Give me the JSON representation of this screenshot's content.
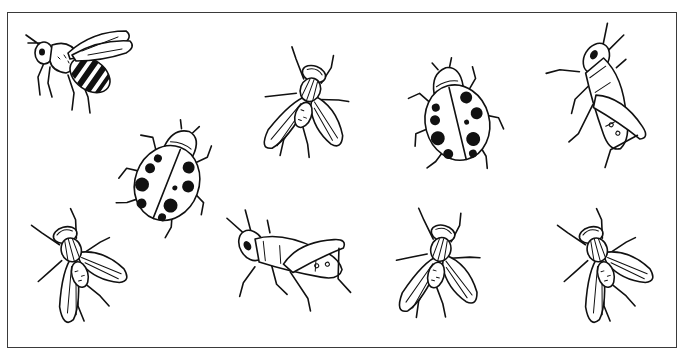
{
  "illustration": {
    "description": "Line drawing of nine insects inside a rectangular frame",
    "frame": {
      "x": 7,
      "y": 12,
      "width": 670,
      "height": 336,
      "stroke": "#3a3a3a"
    },
    "insects": [
      {
        "type": "bee",
        "label": "bee",
        "x": 22,
        "y": 25,
        "rotate": 0
      },
      {
        "type": "ladybug",
        "label": "ladybug",
        "x": 118,
        "y": 115,
        "rotate": 20
      },
      {
        "type": "fly",
        "label": "fly",
        "x": 250,
        "y": 45,
        "rotate": 20
      },
      {
        "type": "ladybug",
        "label": "ladybug",
        "x": 405,
        "y": 55,
        "rotate": -15
      },
      {
        "type": "grasshopper",
        "label": "grasshopper",
        "x": 540,
        "y": 30,
        "rotate": 30
      },
      {
        "type": "fly",
        "label": "fly",
        "x": 22,
        "y": 205,
        "rotate": -15
      },
      {
        "type": "grasshopper",
        "label": "grasshopper",
        "x": 225,
        "y": 190,
        "rotate": -30
      },
      {
        "type": "fly",
        "label": "fly",
        "x": 382,
        "y": 205,
        "rotate": 15
      },
      {
        "type": "fly",
        "label": "fly",
        "x": 548,
        "y": 205,
        "rotate": -15
      }
    ]
  }
}
